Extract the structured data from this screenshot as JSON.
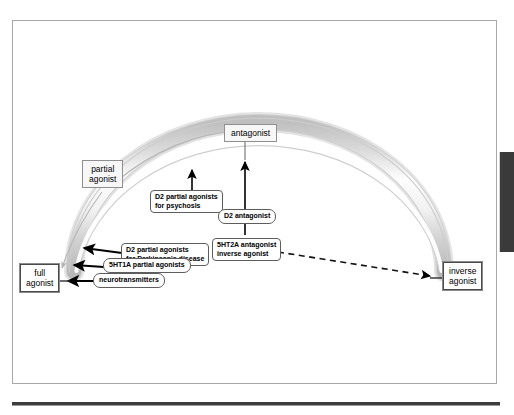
{
  "figure": {
    "type": "receptor-agonist-spectrum-diagram",
    "anchors": {
      "full_agonist": "full\nagonist",
      "full_agonist_line1": "full",
      "full_agonist_line2": "agonist",
      "inverse_agonist_line1": "inverse",
      "inverse_agonist_line2": "agonist",
      "antagonist": "antagonist",
      "partial_agonist_line1": "partial",
      "partial_agonist_line2": "agonist"
    },
    "callouts": [
      {
        "id": "d2-partial-agonists-psychosis",
        "line1": "D2 partial agonists",
        "line2": "for psychosis",
        "shape": "rounded-rect",
        "arrow": "up-to-arch"
      },
      {
        "id": "d2-antagonist",
        "line1": "D2 antagonist",
        "line2": "",
        "shape": "pill",
        "arrow": "up-to-antagonist"
      },
      {
        "id": "5ht2a-antagonist-inverse-agonist",
        "line1": "5HT2A antagonist",
        "line2": "inverse agonist",
        "shape": "rounded-rect",
        "arrow": "up-to-antagonist-and-dashed-right"
      },
      {
        "id": "d2-partial-agonists-parkinsons",
        "line1": "D2 partial agonists",
        "line2": "for Parkinson's disease",
        "shape": "rounded-rect",
        "arrow": "left-to-arch"
      },
      {
        "id": "5ht1a-partial-agonists",
        "line1": "5HT1A partial agonists",
        "line2": "",
        "shape": "pill",
        "arrow": "left-to-arch"
      },
      {
        "id": "neurotransmitters",
        "line1": "neurotransmitters",
        "line2": "",
        "shape": "pill",
        "arrow": "left-to-full-agonist"
      }
    ],
    "colors": {
      "arch_outer": "#c9c9c9",
      "arch_mid": "#e6e6e6",
      "arch_highlight": "#ffffff",
      "arrow": "#000000",
      "dashed_arrow": "#1a1a1a",
      "curved_arrow": "#b0b0b0",
      "frame": "#a8a8a8",
      "tab": "#3a3a3a",
      "text": "#000000"
    }
  }
}
